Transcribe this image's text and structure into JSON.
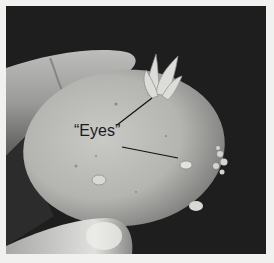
{
  "figure": {
    "background_color": "#1e1e1e",
    "frame_color": "#f1f1ef",
    "annotation": {
      "label": "“Eyes”",
      "pointer_count": 2
    }
  }
}
